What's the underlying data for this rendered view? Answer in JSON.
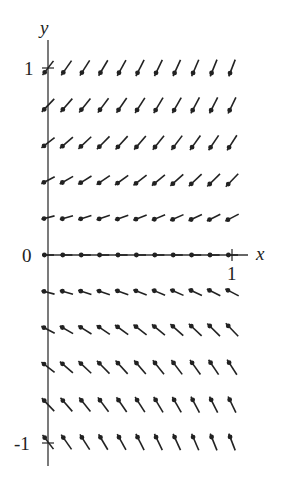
{
  "figure": {
    "type": "slope_field",
    "axis_labels": {
      "x": "x",
      "y": "y"
    },
    "tick_labels": {
      "y_top": "1",
      "y_origin": "0",
      "y_bottom": "-1",
      "x_one": "1"
    },
    "x_range": [
      0,
      1
    ],
    "y_range": [
      -1,
      1
    ],
    "grid": {
      "x_values": [
        0,
        0.1,
        0.2,
        0.3,
        0.4,
        0.5,
        0.6,
        0.7,
        0.8,
        0.9,
        1.0
      ],
      "y_values": [
        1,
        0.8,
        0.6,
        0.4,
        0.2,
        0,
        -0.2,
        -0.4,
        -0.6,
        -0.8,
        -1
      ]
    },
    "slope_rule": "slope increases with y and with x; zero on y=0, positive above, negative below",
    "colors": {
      "ink": "#222222",
      "background": "#ffffff"
    }
  }
}
